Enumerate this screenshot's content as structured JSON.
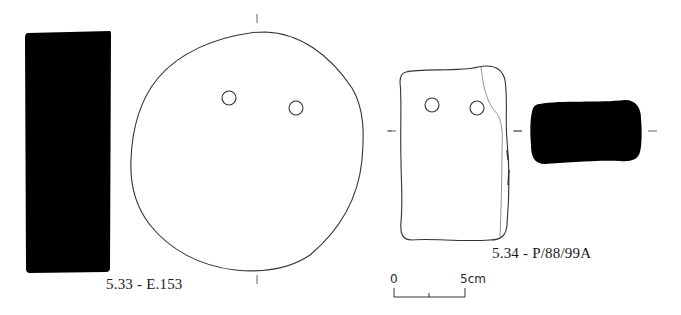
{
  "figure": {
    "objects": [
      {
        "id": "5.33",
        "label": "5.33 - E.153",
        "views": [
          "section-profile-black",
          "plan-view-disc-with-two-perforations"
        ]
      },
      {
        "id": "5.34",
        "label": "5.34 - P/88/99A",
        "views": [
          "plan-view-rectangular-with-two-perforations",
          "section-profile-black"
        ]
      }
    ],
    "scale_bar": {
      "start_label": "0",
      "end_label": "5cm"
    },
    "colors": {
      "ink": "#000000",
      "outline": "#3a3a3a",
      "background": "#ffffff"
    }
  }
}
